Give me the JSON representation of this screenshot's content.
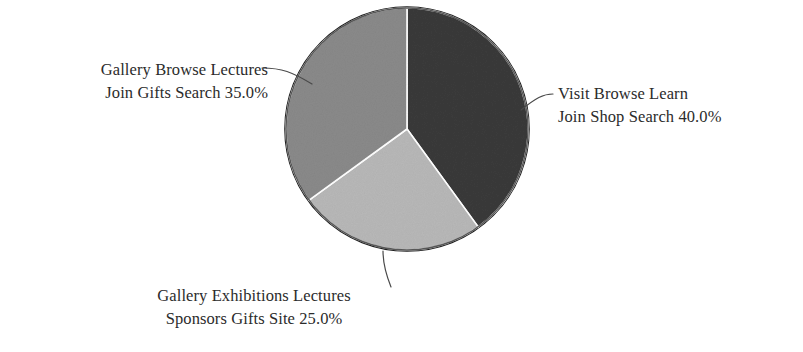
{
  "chart_data": {
    "type": "pie",
    "title": "",
    "subtitle": "",
    "xlabel": "",
    "ylabel": "",
    "legend_position": "none",
    "grid": false,
    "labels_outside": true,
    "leader_lines": true,
    "background_color": "#ffffff",
    "text_color": "#2b2b2b",
    "outline_color": "#2e2e2e",
    "start_angle_deg": 0,
    "direction": "clockwise",
    "categories": [
      "Visit Browse Learn Join Shop Search",
      "Gallery Exhibitions Lectures Sponsors Gifts Site",
      "Gallery Browse Lectures Join Gifts Search"
    ],
    "values": [
      40.0,
      35.0,
      25.0
    ],
    "slices": [
      {
        "id": "slice-visit-browse-learn",
        "label_line1": "Visit Browse Learn",
        "label_line2": "Join Shop Search 40.0%",
        "value": 40.0,
        "percent_text": "40.0%",
        "color": "#3a3a3a",
        "start_deg": 0,
        "end_deg": 144
      },
      {
        "id": "slice-gallery-exhibitions-lectures",
        "label_line1": "Gallery Exhibitions Lectures",
        "label_line2": "Sponsors Gifts Site 25.0%",
        "value": 25.0,
        "percent_text": "25.0%",
        "color": "#b8b8b8",
        "start_deg": 144,
        "end_deg": 234
      },
      {
        "id": "slice-gallery-browse-lectures",
        "label_line1": "Gallery Browse Lectures",
        "label_line2": "Join Gifts Search 35.0%",
        "value": 35.0,
        "percent_text": "35.0%",
        "color": "#8a8a8a",
        "start_deg": 234,
        "end_deg": 360
      }
    ]
  },
  "labels": {
    "right": {
      "line1": "Visit Browse Learn",
      "line2": "Join Shop Search 40.0%"
    },
    "bottom": {
      "line1": "Gallery Exhibitions Lectures",
      "line2": "Sponsors Gifts Site 25.0%"
    },
    "left": {
      "line1": "Gallery Browse Lectures",
      "line2": "Join Gifts Search 35.0%"
    }
  },
  "colors": {
    "slice_dark": "#3a3a3a",
    "slice_medium": "#8a8a8a",
    "slice_light": "#b8b8b8",
    "outline": "#2e2e2e",
    "text": "#2b2b2b",
    "background": "#ffffff"
  }
}
